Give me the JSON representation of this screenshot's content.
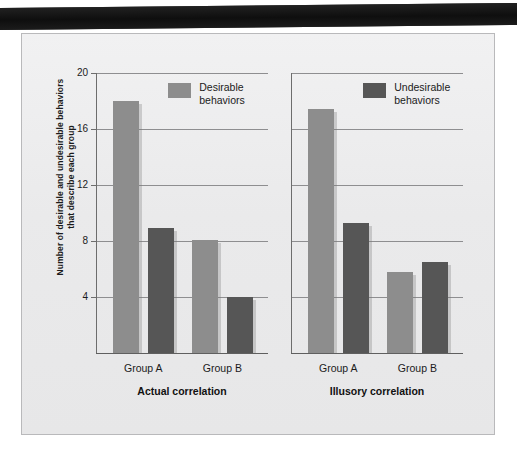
{
  "page": {
    "background_color": "#ffffff",
    "panel_background_color": "#ececed",
    "top_band_color": "#161616"
  },
  "chart_data": {
    "type": "bar",
    "title": "",
    "xlabel": "",
    "ylabel": "Number of desirable and undesirable behaviors that describe each group",
    "ylim": [
      0,
      20
    ],
    "yticks": [
      4,
      8,
      12,
      16,
      20
    ],
    "ytick_labels": [
      "4",
      "8",
      "12",
      "16",
      "20"
    ],
    "grid": true,
    "legend_position": "top-right of each panel",
    "legend": [
      {
        "name": "Desirable behaviors",
        "line1": "Desirable",
        "line2": "behaviors",
        "color": "#8d8d8d"
      },
      {
        "name": "Undesirable behaviors",
        "line1": "Undesirable",
        "line2": "behaviors",
        "color": "#565656"
      }
    ],
    "panels": [
      {
        "label": "Actual correlation",
        "categories": [
          "Group A",
          "Group B"
        ],
        "series": [
          {
            "name": "Desirable behaviors",
            "color": "#8d8d8d",
            "values": [
              18.0,
              8.1
            ]
          },
          {
            "name": "Undesirable behaviors",
            "color": "#565656",
            "values": [
              8.9,
              4.0
            ]
          }
        ]
      },
      {
        "label": "Illusory correlation",
        "categories": [
          "Group A",
          "Group B"
        ],
        "series": [
          {
            "name": "Desirable behaviors",
            "color": "#8d8d8d",
            "values": [
              17.4,
              5.8
            ]
          },
          {
            "name": "Undesirable behaviors",
            "color": "#565656",
            "values": [
              9.3,
              6.5
            ]
          }
        ]
      }
    ]
  }
}
